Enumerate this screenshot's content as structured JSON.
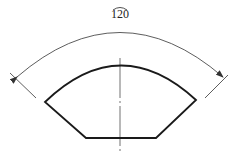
{
  "diagram": {
    "type": "technical-drawing",
    "dimension": {
      "label": "120",
      "symbol": "arc-length",
      "style": "arc dimension with arrowheads at both ends"
    },
    "colors": {
      "outline": "#1a1a1a",
      "dimension": "#333333",
      "background": "#ffffff"
    }
  }
}
